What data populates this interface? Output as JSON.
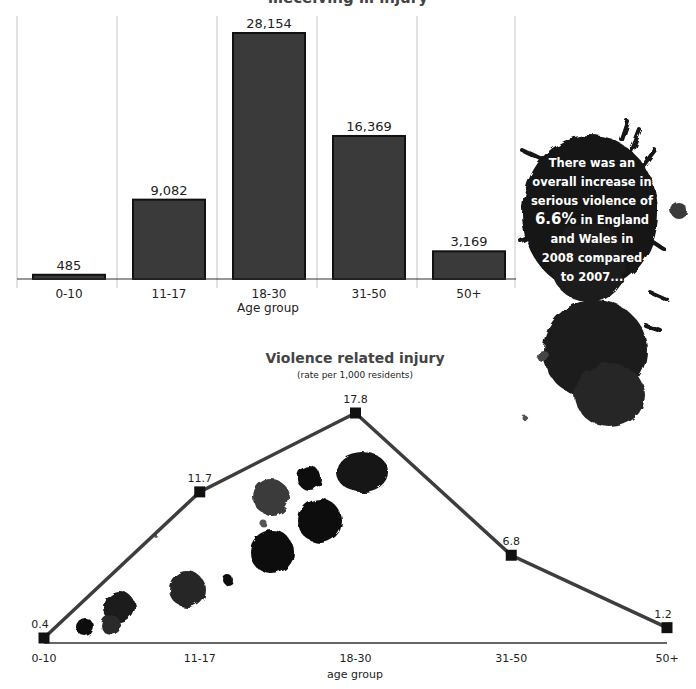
{
  "chart_data": [
    {
      "type": "bar",
      "title": "…eceiving … injury",
      "title_partially_visible": true,
      "categories": [
        "0-10",
        "11-17",
        "18-30",
        "31-50",
        "50+"
      ],
      "values": [
        485,
        9082,
        28154,
        16369,
        3169
      ],
      "data_labels": [
        "485",
        "9,082",
        "28,154",
        "16,369",
        "3,169"
      ],
      "xlabel": "Age group",
      "ylabel": "",
      "ylim": [
        0,
        30000
      ],
      "grid": "vertical-separators",
      "legend": "none",
      "colors": {
        "bar_fill": "#3a3a3a",
        "bar_edge": "#111111",
        "grid": "#cfcfcf",
        "axis": "#333333"
      }
    },
    {
      "type": "line",
      "title": "Violence related injury",
      "subtitle": "(rate per 1,000 residents)",
      "categories": [
        "0-10",
        "11-17",
        "18-30",
        "31-50",
        "50+"
      ],
      "values": [
        0.4,
        11.7,
        17.8,
        6.8,
        1.2
      ],
      "data_labels": [
        "0.4",
        "11.7",
        "17.8",
        "6.8",
        "1.2"
      ],
      "xlabel": "age group",
      "ylabel": "",
      "ylim": [
        0,
        19
      ],
      "grid": false,
      "legend": "none",
      "marker": "square",
      "colors": {
        "line": "#3d3d3d",
        "marker": "#111111",
        "axis": "#333333"
      }
    }
  ],
  "callout": {
    "lines": [
      "There was an",
      "overall increase in",
      "serious violence of",
      "6.6% in England",
      "and Wales in",
      "2008 compared",
      "to 2007..."
    ],
    "highlight": "6.6%",
    "ink_color": "#141414",
    "text_color": "#ffffff"
  },
  "decoration": {
    "ink_splats": "black ink splatter blots"
  }
}
